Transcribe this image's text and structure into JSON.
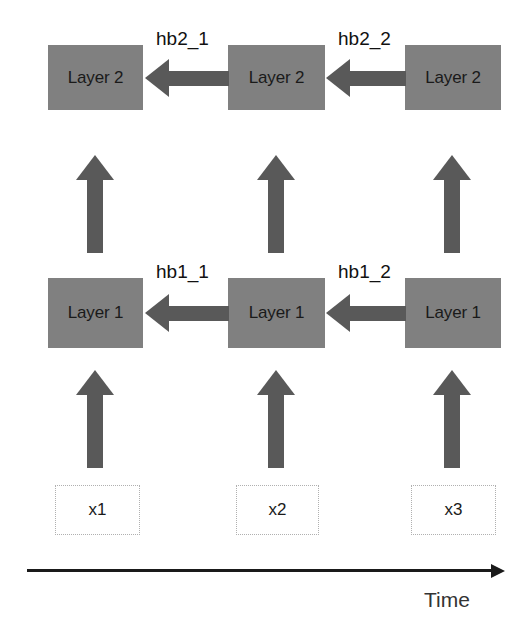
{
  "diagram": {
    "colors": {
      "block_fill": "#808080",
      "arrow_fill": "#595959",
      "axis": "#1a1a1a",
      "input_border": "#b0b0b0",
      "background": "#ffffff"
    },
    "rows": {
      "layer2": {
        "label": "Layer 2",
        "blocks": [
          {
            "text": "Layer 2",
            "column": 1
          },
          {
            "text": "Layer 2",
            "column": 2
          },
          {
            "text": "Layer 2",
            "column": 3
          }
        ]
      },
      "layer1": {
        "label": "Layer 1",
        "blocks": [
          {
            "text": "Layer 1",
            "column": 1
          },
          {
            "text": "Layer 1",
            "column": 2
          },
          {
            "text": "Layer 1",
            "column": 3
          }
        ]
      },
      "inputs": {
        "blocks": [
          {
            "text": "x1",
            "column": 1
          },
          {
            "text": "x2",
            "column": 2
          },
          {
            "text": "x3",
            "column": 3
          }
        ]
      }
    },
    "recurrent_edges": [
      {
        "label": "hb2_1",
        "row": "layer2",
        "from_column": 2,
        "to_column": 1,
        "direction": "right-to-left"
      },
      {
        "label": "hb2_2",
        "row": "layer2",
        "from_column": 3,
        "to_column": 2,
        "direction": "right-to-left"
      },
      {
        "label": "hb1_1",
        "row": "layer1",
        "from_column": 2,
        "to_column": 1,
        "direction": "right-to-left"
      },
      {
        "label": "hb1_2",
        "row": "layer1",
        "from_column": 3,
        "to_column": 2,
        "direction": "right-to-left"
      }
    ],
    "vertical_edges": [
      {
        "from": "layer1",
        "to": "layer2",
        "column": 1
      },
      {
        "from": "layer1",
        "to": "layer2",
        "column": 2
      },
      {
        "from": "layer1",
        "to": "layer2",
        "column": 3
      },
      {
        "from": "input",
        "to": "layer1",
        "column": 1
      },
      {
        "from": "input",
        "to": "layer1",
        "column": 2
      },
      {
        "from": "input",
        "to": "layer1",
        "column": 3
      }
    ],
    "axis": {
      "label": "Time",
      "direction": "left-to-right"
    }
  }
}
